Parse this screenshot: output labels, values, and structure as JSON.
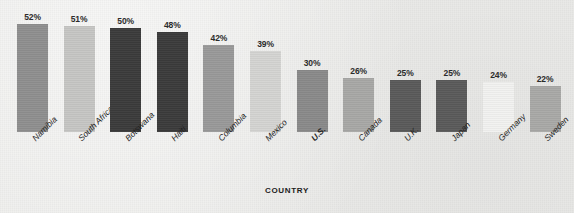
{
  "chart_data": {
    "type": "bar",
    "title": "",
    "subtitle": "",
    "xlabel": "COUNTRY",
    "ylabel": "",
    "ylim": [
      0,
      60
    ],
    "grid": false,
    "legend": "none",
    "value_suffix": "%",
    "categories": [
      "Namibia",
      "South Africa",
      "Botswana",
      "Haiti",
      "Columbia",
      "Mexico",
      "U.S.",
      "Canada",
      "U.K.",
      "Japan",
      "Germany",
      "Sweden"
    ],
    "values": [
      52,
      51,
      50,
      48,
      42,
      39,
      30,
      26,
      25,
      25,
      24,
      22
    ],
    "data_labels": [
      "52%",
      "51%",
      "50%",
      "48%",
      "42%",
      "39%",
      "30%",
      "26%",
      "25%",
      "25%",
      "24%",
      "22%"
    ],
    "bar_colors": [
      "#8f8f8f",
      "#c6c6c4",
      "#3b3b3b",
      "#3b3b3b",
      "#999999",
      "#d4d4d2",
      "#8a8a8a",
      "#a8a8a6",
      "#5a5a5a",
      "#5a5a5a",
      "#f2f2f0",
      "#a9a9a7"
    ],
    "highlighted_category": "U.S.",
    "bars": [
      {
        "category": "Namibia",
        "value": 52,
        "label": "52%",
        "color": "#8f8f8f",
        "highlight": false
      },
      {
        "category": "South Africa",
        "value": 51,
        "label": "51%",
        "color": "#c6c6c4",
        "highlight": false
      },
      {
        "category": "Botswana",
        "value": 50,
        "label": "50%",
        "color": "#3b3b3b",
        "highlight": false
      },
      {
        "category": "Haiti",
        "value": 48,
        "label": "48%",
        "color": "#3b3b3b",
        "highlight": false
      },
      {
        "category": "Columbia",
        "value": 42,
        "label": "42%",
        "color": "#999999",
        "highlight": false
      },
      {
        "category": "Mexico",
        "value": 39,
        "label": "39%",
        "color": "#d4d4d2",
        "highlight": false
      },
      {
        "category": "U.S.",
        "value": 30,
        "label": "30%",
        "color": "#8a8a8a",
        "highlight": true
      },
      {
        "category": "Canada",
        "value": 26,
        "label": "26%",
        "color": "#a8a8a6",
        "highlight": false
      },
      {
        "category": "U.K.",
        "value": 25,
        "label": "25%",
        "color": "#5a5a5a",
        "highlight": false
      },
      {
        "category": "Japan",
        "value": 25,
        "label": "25%",
        "color": "#5a5a5a",
        "highlight": false
      },
      {
        "category": "Germany",
        "value": 24,
        "label": "24%",
        "color": "#f2f2f0",
        "highlight": false
      },
      {
        "category": "Sweden",
        "value": 22,
        "label": "22%",
        "color": "#a9a9a7",
        "highlight": false
      }
    ]
  },
  "colors": {
    "background": "#ededeb",
    "text": "#1f1f1f",
    "value_text": "#2b2b2b"
  }
}
